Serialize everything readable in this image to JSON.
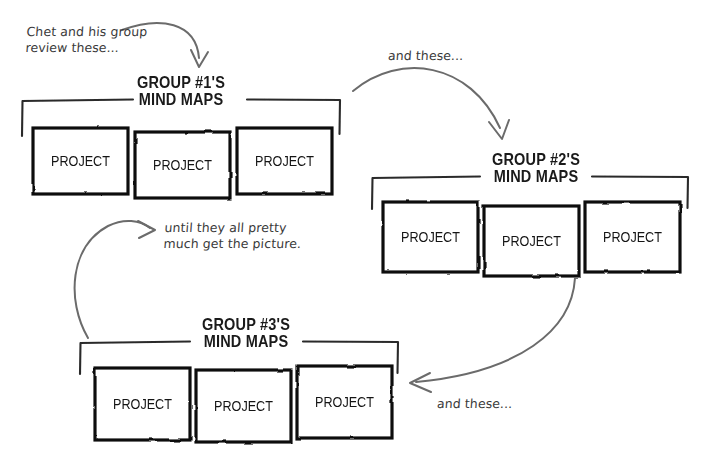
{
  "diagram": {
    "background_color": "#ffffff",
    "ink_color": "#1a1a1a",
    "arrow_color": "#666666",
    "type": "cyclical hand-drawn flow diagram"
  },
  "groups": [
    {
      "id": "group-1",
      "title_line1": "GROUP #1'S",
      "title_line2": "MIND MAPS",
      "projects": [
        "PROJECT",
        "PROJECT",
        "PROJECT"
      ]
    },
    {
      "id": "group-2",
      "title_line1": "GROUP #2'S",
      "title_line2": "MIND MAPS",
      "projects": [
        "PROJECT",
        "PROJECT",
        "PROJECT"
      ]
    },
    {
      "id": "group-3",
      "title_line1": "GROUP #3'S",
      "title_line2": "MIND MAPS",
      "projects": [
        "PROJECT",
        "PROJECT",
        "PROJECT"
      ]
    }
  ],
  "annotations": {
    "start": "Chet and his group\nreview these...",
    "to_group2": "and these...",
    "to_group3": "and these...",
    "loop": "until they all pretty\nmuch get the picture."
  }
}
